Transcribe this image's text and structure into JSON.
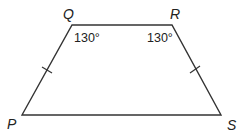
{
  "figure": {
    "type": "trapezoid",
    "vertices": {
      "P": {
        "label": "P",
        "x": 22,
        "y": 115
      },
      "Q": {
        "label": "Q",
        "x": 72,
        "y": 25
      },
      "R": {
        "label": "R",
        "x": 172,
        "y": 25
      },
      "S": {
        "label": "S",
        "x": 221,
        "y": 115
      }
    },
    "angles": {
      "Q": "130°",
      "R": "130°"
    },
    "congruent_sides": [
      "PQ",
      "RS"
    ],
    "colors": {
      "stroke": "#333333",
      "text": "#222222",
      "background": "#ffffff"
    }
  }
}
